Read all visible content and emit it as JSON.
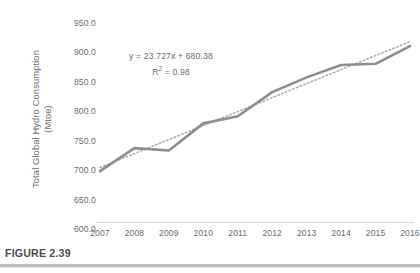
{
  "figure": {
    "caption": "FIGURE 2.39"
  },
  "chart_data": {
    "type": "line",
    "title": "",
    "xlabel": "",
    "ylabel": "Total Global Hydro Consumption (Mtoe)",
    "ylabel_line1": "Total Global Hydro Consumption",
    "ylabel_line2": "(Mtoe)",
    "x": [
      2007,
      2008,
      2009,
      2010,
      2011,
      2012,
      2013,
      2014,
      2015,
      2016
    ],
    "categories": [
      "2007",
      "2008",
      "2009",
      "2010",
      "2011",
      "2012",
      "2013",
      "2014",
      "2015",
      "2016"
    ],
    "series": [
      {
        "name": "Total Global Hydro Consumption",
        "values": [
          698.0,
          737.0,
          733.0,
          779.0,
          791.0,
          832.0,
          857.0,
          878.0,
          880.0,
          910.0
        ],
        "style": "solid",
        "color": "#8d8d8d"
      },
      {
        "name": "Linear trendline",
        "values": [
          704.1,
          727.8,
          751.6,
          775.3,
          799.0,
          822.7,
          846.5,
          870.2,
          893.9,
          917.7
        ],
        "style": "dotted",
        "color": "#a9a9a9"
      }
    ],
    "ylim": [
      600.0,
      950.0
    ],
    "yticks": [
      600.0,
      650.0,
      700.0,
      750.0,
      800.0,
      850.0,
      900.0,
      950.0
    ],
    "ytick_labels": [
      "600.0",
      "650.0",
      "700.0",
      "750.0",
      "800.0",
      "850.0",
      "900.0",
      "950.0"
    ],
    "grid": false,
    "legend": "none",
    "annotations": {
      "trendline_equation": "y = 23.727x + 680.38",
      "r_squared_label": "R",
      "r_squared_exponent": "2",
      "r_squared_value": " = 0.98"
    },
    "colors": {
      "series_line": "#8d8d8d",
      "trendline": "#a9a9a9",
      "axis": "#d6d7d8",
      "text": "#6b6c6e",
      "caption_rule": "#bcbec0"
    }
  }
}
